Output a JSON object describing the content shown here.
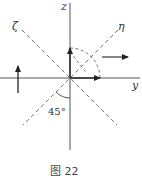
{
  "diagram": {
    "axes": {
      "z_label": "z",
      "y_label": "y",
      "zeta_label": "ζ",
      "eta_label": "η"
    },
    "angle_label": "45°",
    "caption": "图 22",
    "colors": {
      "line": "#333333",
      "dashed": "#666666",
      "background": "#ffffff"
    }
  }
}
